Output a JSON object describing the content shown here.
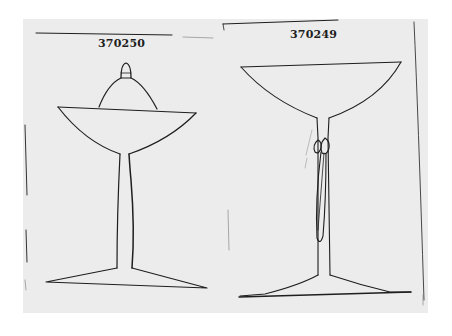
{
  "document": {
    "type": "catalog-illustration-scan",
    "background_color": "#ffffff",
    "paper_color": "#ececec",
    "ink_color": "#1e1e1e"
  },
  "figures": [
    {
      "id": "left",
      "catalog_number": "370250",
      "description": "Covered compote / sherbet with domed lid and knob finial, wide shallow bowl, tall slender stem, flat conical foot"
    },
    {
      "id": "right",
      "catalog_number": "370249",
      "description": "Wide-bowl champagne / sherbet glass with twisted ribbon ornament on stem, flat conical foot"
    }
  ]
}
